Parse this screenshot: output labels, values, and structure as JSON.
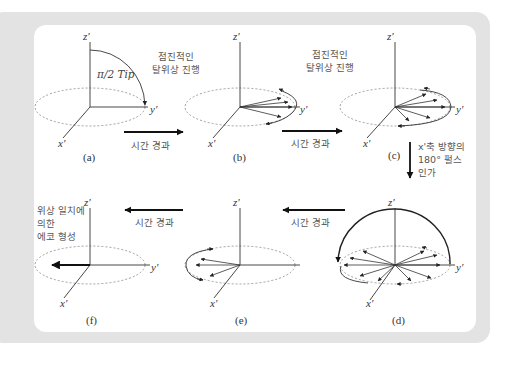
{
  "figure": {
    "axes": {
      "z": "z'",
      "y": "y'",
      "x": "x'"
    },
    "panels": [
      {
        "id": "a",
        "label": "(a)",
        "annotation": "π/2 Tip"
      },
      {
        "id": "b",
        "label": "(b)"
      },
      {
        "id": "c",
        "label": "(c)"
      },
      {
        "id": "d",
        "label": "(d)"
      },
      {
        "id": "e",
        "label": "(e)"
      },
      {
        "id": "f",
        "label": "(f)"
      }
    ],
    "captions": {
      "dephasing_1_line1": "점진적인",
      "dephasing_1_line2": "탈위상 진행",
      "dephasing_2_line1": "점진적인",
      "dephasing_2_line2": "탈위상 진행",
      "time_ab": "시간 경과",
      "time_bc": "시간 경과",
      "time_de": "시간 경과",
      "time_ef": "시간 경과",
      "pulse_line1": "x'축 방향의",
      "pulse_line2": "180° 펄스",
      "pulse_line3": "인가",
      "echo_line1": "위상 일치에",
      "echo_line2": "의한",
      "echo_line3": "에코 형성"
    }
  },
  "colors": {
    "background_frame": "#e3e3e3",
    "panel": "#ffffff",
    "line": "#2a2a2a",
    "dotted": "#888888"
  }
}
